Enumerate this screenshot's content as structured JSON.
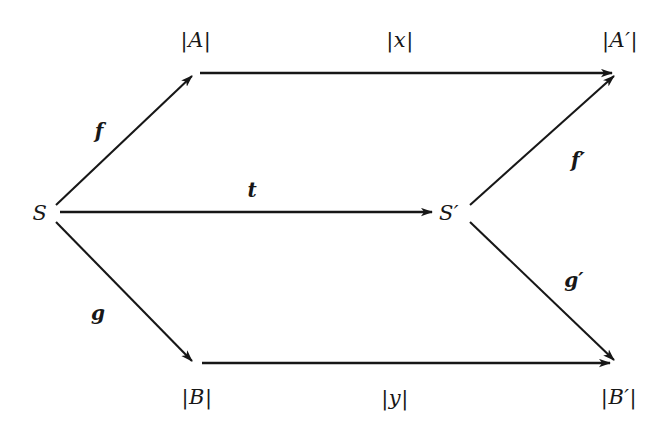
{
  "diagram": {
    "ink_color": "#171717",
    "background_color": "#ffffff",
    "nodes": [
      {
        "id": "S",
        "label": "S",
        "x": 40,
        "y": 213
      },
      {
        "id": "A",
        "label": "|A|",
        "x": 196,
        "y": 40
      },
      {
        "id": "B",
        "label": "|B|",
        "x": 197,
        "y": 397
      },
      {
        "id": "Sp",
        "label": "S′",
        "x": 449,
        "y": 213
      },
      {
        "id": "Ap",
        "label": "|A′|",
        "x": 620,
        "y": 40
      },
      {
        "id": "Bp",
        "label": "|B′|",
        "x": 619,
        "y": 397
      }
    ],
    "edges": [
      {
        "id": "f",
        "label": "f",
        "from": "S",
        "to": "A",
        "label_x": 99,
        "label_y": 131
      },
      {
        "id": "t",
        "label": "t",
        "from": "S",
        "to": "Sp",
        "label_x": 252,
        "label_y": 190
      },
      {
        "id": "g",
        "label": "g",
        "from": "S",
        "to": "B",
        "label_x": 98,
        "label_y": 313
      },
      {
        "id": "x",
        "label": "|x|",
        "from": "A",
        "to": "Ap",
        "label_x": 400,
        "label_y": 40
      },
      {
        "id": "y",
        "label": "|y|",
        "from": "B",
        "to": "Bp",
        "label_x": 395,
        "label_y": 398
      },
      {
        "id": "fp",
        "label": "f′",
        "from": "Sp",
        "to": "Ap",
        "label_x": 578,
        "label_y": 160
      },
      {
        "id": "gp",
        "label": "g′",
        "from": "Sp",
        "to": "Bp",
        "label_x": 574,
        "label_y": 280
      }
    ]
  }
}
